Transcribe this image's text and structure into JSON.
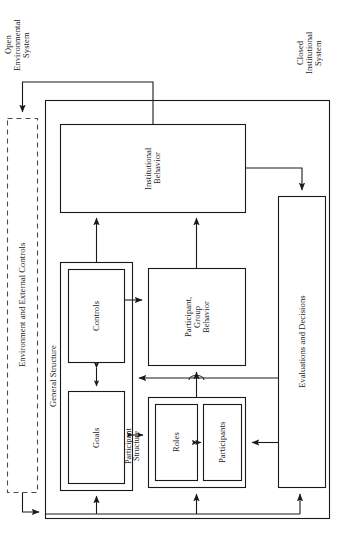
{
  "diagram": {
    "type": "block-diagram",
    "orientation": "rotated-90-ccw",
    "system_labels": {
      "open": "Open\nEnvironmental\nSystem",
      "closed": "Closed\nInstitutional\nSystem"
    },
    "boxes": {
      "environment": "Environment and External Controls",
      "institutional_behavior": "Institutional\nBehavior",
      "general_structure": "General Structure",
      "controls": "Controls",
      "goals": "Goals",
      "participant_group_behavior": "Participant,\nGroup\nBehavior",
      "participant_structure": "Participant\nStructure",
      "roles": "Roles",
      "participants": "Participants",
      "evaluations": "Evaluations and Decisions"
    },
    "colors": {
      "stroke": "#1a1a1a",
      "background": "#ffffff",
      "dashed_stroke": "#4a4a4a"
    }
  }
}
